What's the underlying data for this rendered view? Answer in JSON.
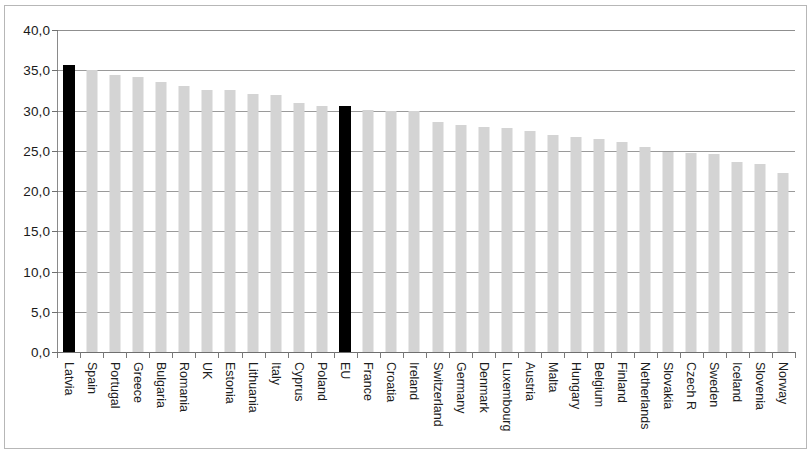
{
  "chart_data": {
    "type": "bar",
    "title": "",
    "subtitle": "",
    "xlabel": "",
    "ylabel": "",
    "ylim": [
      0.0,
      40.0
    ],
    "y_ticks": [
      "0,0",
      "5,0",
      "10,0",
      "15,0",
      "20,0",
      "25,0",
      "30,0",
      "35,0",
      "40,0"
    ],
    "y_tick_values": [
      0.0,
      5.0,
      10.0,
      15.0,
      20.0,
      25.0,
      30.0,
      35.0,
      40.0
    ],
    "grid": true,
    "legend": "none",
    "decimal_separator": ",",
    "categories": [
      "Latvia",
      "Spain",
      "Portugal",
      "Greece",
      "Bulgaria",
      "Romania",
      "UK",
      "Estonia",
      "Lithuania",
      "Italy",
      "Cyprus",
      "Poland",
      "EU",
      "France",
      "Croatia",
      "Ireland",
      "Switzerland",
      "Germany",
      "Denmark",
      "Luxembourg",
      "Austria",
      "Malta",
      "Hungary",
      "Belgium",
      "Finland",
      "Netherlands",
      "Slovakia",
      "Czech R",
      "Sweden",
      "Iceland",
      "Slovenia",
      "Norway"
    ],
    "values": [
      35.7,
      35.0,
      34.4,
      34.2,
      33.5,
      33.1,
      32.6,
      32.5,
      32.1,
      31.9,
      30.9,
      30.6,
      30.5,
      30.1,
      30.0,
      30.0,
      28.6,
      28.2,
      28.0,
      27.8,
      27.5,
      27.0,
      26.7,
      26.5,
      26.1,
      25.5,
      24.8,
      24.7,
      24.6,
      23.6,
      23.4,
      22.3
    ],
    "highlighted_categories": [
      "Latvia",
      "EU"
    ],
    "colors": {
      "bar": "#d4d4d4",
      "bar_highlight": "#000000",
      "gridline": "#9a9a9a",
      "axis": "#6f6f6f",
      "frame": "#b7b7b7",
      "text": "#1a1a1a",
      "background": "#ffffff"
    }
  }
}
